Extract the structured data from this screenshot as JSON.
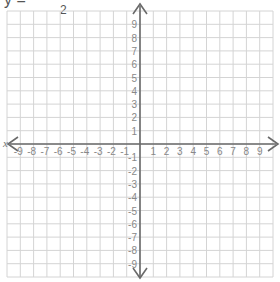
{
  "equation": {
    "text_visible": "y = ",
    "fraction_denominator": "2",
    "text_after": "x + 3"
  },
  "grid": {
    "x_axis_label": "x",
    "x_min": -9,
    "x_max": 9,
    "y_min": -9,
    "y_max": 9,
    "x_ticks_negative": [
      "-9",
      "-8",
      "-7",
      "-6",
      "-5",
      "-4",
      "-3",
      "-2",
      "-1"
    ],
    "x_ticks_positive": [
      "1",
      "2",
      "3",
      "4",
      "5",
      "6",
      "7",
      "8",
      "9"
    ],
    "y_ticks_positive": [
      "9",
      "8",
      "7",
      "6",
      "5",
      "4",
      "3",
      "2",
      "1"
    ],
    "y_ticks_negative": [
      "-1",
      "-2",
      "-3",
      "-4",
      "-5",
      "-6",
      "-7",
      "-8",
      "-9"
    ],
    "colors": {
      "grid": "#d4d4d4",
      "axis": "#6a6a6a",
      "label": "#888888"
    }
  }
}
